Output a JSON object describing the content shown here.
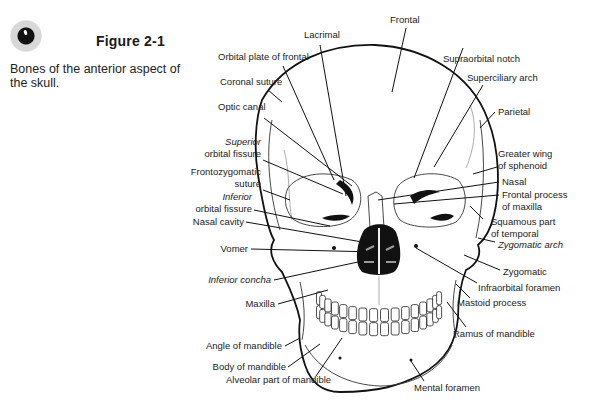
{
  "figure": {
    "icon": "bullet-icon",
    "title": "Figure 2-1",
    "caption": "Bones of the anterior aspect of the skull."
  },
  "labels": {
    "frontal": "Frontal",
    "lacrimal": "Lacrimal",
    "orbital_plate": "Orbital plate of frontal",
    "coronal_suture": "Coronal suture",
    "optic_canal": "Optic canal",
    "superior_orbital_fissure_1": "Superior",
    "superior_orbital_fissure_2": "orbital fissure",
    "frontozygomatic_1": "Frontozygomatic",
    "frontozygomatic_2": "suture",
    "inferior_orbital_fissure_1": "Inferior",
    "inferior_orbital_fissure_2": "orbital fissure",
    "nasal_cavity": "Nasal cavity",
    "vomer": "Vomer",
    "inferior_concha": "Inferior concha",
    "maxilla": "Maxilla",
    "angle_of_mandible": "Angle of mandible",
    "body_of_mandible": "Body of  mandible",
    "alveolar_part": "Alveolar part of mandible",
    "supraorbital_notch": "Supraorbital notch",
    "superciliary_arch": "Superciliary arch",
    "parietal": "Parietal",
    "greater_wing_1": "Greater wing",
    "greater_wing_2": "of sphenoid",
    "nasal": "Nasal",
    "frontal_process_1": "Frontal process",
    "frontal_process_2": "of maxilla",
    "squamous_1": "Squamous part",
    "squamous_2": "of temporal",
    "zygomatic_arch": "Zygomatic arch",
    "zygomatic": "Zygomatic",
    "infraorbital_foramen": "Infraorbital foramen",
    "mastoid_process": "Mastoid process",
    "ramus_of_mandible": "Ramus of mandible",
    "mental_foramen": "Mental foramen"
  }
}
